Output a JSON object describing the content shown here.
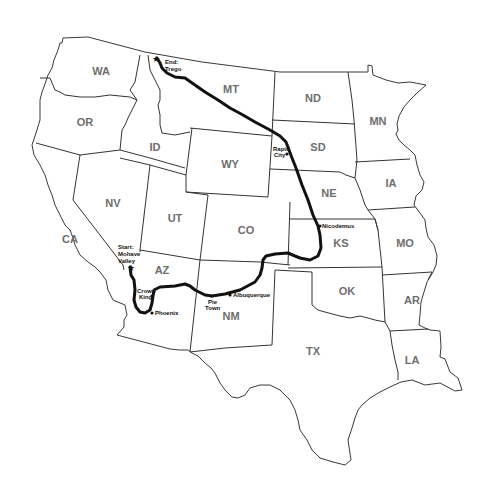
{
  "map": {
    "type": "route-map",
    "region": "Western and Central United States",
    "route_color": "#111111",
    "border_color": "#3a3a3a",
    "label_color": "#6e6e6e",
    "states": [
      {
        "abbr": "WA",
        "x": 101,
        "y": 71
      },
      {
        "abbr": "OR",
        "x": 85,
        "y": 122
      },
      {
        "abbr": "CA",
        "x": 70,
        "y": 240
      },
      {
        "abbr": "NV",
        "x": 113,
        "y": 204
      },
      {
        "abbr": "ID",
        "x": 155,
        "y": 147
      },
      {
        "abbr": "MT",
        "x": 231,
        "y": 89
      },
      {
        "abbr": "WY",
        "x": 230,
        "y": 164
      },
      {
        "abbr": "UT",
        "x": 175,
        "y": 218
      },
      {
        "abbr": "CO",
        "x": 246,
        "y": 230
      },
      {
        "abbr": "AZ",
        "x": 162,
        "y": 270
      },
      {
        "abbr": "NM",
        "x": 231,
        "y": 316
      },
      {
        "abbr": "ND",
        "x": 313,
        "y": 98
      },
      {
        "abbr": "SD",
        "x": 318,
        "y": 147
      },
      {
        "abbr": "NE",
        "x": 329,
        "y": 193
      },
      {
        "abbr": "KS",
        "x": 341,
        "y": 243
      },
      {
        "abbr": "OK",
        "x": 347,
        "y": 291
      },
      {
        "abbr": "TX",
        "x": 313,
        "y": 351
      },
      {
        "abbr": "MN",
        "x": 378,
        "y": 121
      },
      {
        "abbr": "IA",
        "x": 391,
        "y": 183
      },
      {
        "abbr": "MO",
        "x": 405,
        "y": 243
      },
      {
        "abbr": "AR",
        "x": 412,
        "y": 300
      },
      {
        "abbr": "LA",
        "x": 412,
        "y": 360
      }
    ],
    "places": [
      {
        "id": "start",
        "label_lines": [
          "Start:",
          "Mohave",
          "Valley"
        ],
        "marker": "star",
        "x": 130,
        "y": 267
      },
      {
        "id": "crown-king",
        "label_lines": [
          "Crown",
          "King"
        ],
        "marker": "dot",
        "x": 152,
        "y": 296
      },
      {
        "id": "phoenix",
        "label_lines": [
          "Phoenix"
        ],
        "marker": "dot",
        "x": 152,
        "y": 313
      },
      {
        "id": "pie-town",
        "label_lines": [
          "Pie",
          "Town"
        ],
        "marker": "dot",
        "x": 212,
        "y": 296
      },
      {
        "id": "albuquerque",
        "label_lines": [
          "Albuquerque"
        ],
        "marker": "dot",
        "x": 230,
        "y": 295
      },
      {
        "id": "nicodemus",
        "label_lines": [
          "Nicodemus"
        ],
        "marker": "dot",
        "x": 320,
        "y": 226
      },
      {
        "id": "rapid-city",
        "label_lines": [
          "Rapid",
          "City"
        ],
        "marker": "dot",
        "x": 287,
        "y": 154
      },
      {
        "id": "end",
        "label_lines": [
          "End:",
          "Trego"
        ],
        "marker": "star",
        "x": 157,
        "y": 58
      }
    ],
    "labels": {
      "start": [
        "Start:",
        "Mohave",
        "Valley"
      ],
      "crown_king": [
        "Crown",
        "King"
      ],
      "phoenix": "Phoenix",
      "pie_town": [
        "Pie",
        "Town"
      ],
      "albuquerque": "Albuquerque",
      "nicodemus": "Nicodemus",
      "rapid_city": [
        "Rapid",
        "City"
      ],
      "end": [
        "End:",
        "Trego"
      ]
    },
    "state_names": {
      "WA": "WA",
      "OR": "OR",
      "CA": "CA",
      "NV": "NV",
      "ID": "ID",
      "MT": "MT",
      "WY": "WY",
      "UT": "UT",
      "CO": "CO",
      "AZ": "AZ",
      "NM": "NM",
      "ND": "ND",
      "SD": "SD",
      "NE": "NE",
      "KS": "KS",
      "OK": "OK",
      "TX": "TX",
      "MN": "MN",
      "IA": "IA",
      "MO": "MO",
      "AR": "AR",
      "LA": "LA"
    }
  }
}
